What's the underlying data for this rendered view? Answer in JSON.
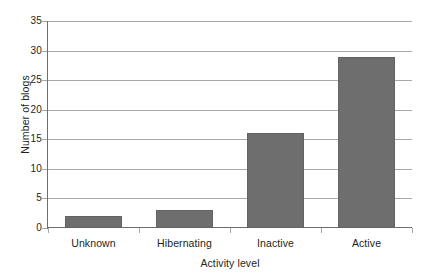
{
  "chart_data": {
    "type": "bar",
    "title": "",
    "categories": [
      "Unknown",
      "Hibernating",
      "Inactive",
      "Active"
    ],
    "values": [
      2,
      3,
      16,
      29
    ],
    "xlabel": "Activity level",
    "ylabel": "Number of blogs",
    "ylim": [
      0,
      35
    ],
    "ytick_step": 5,
    "yticks": [
      "0",
      "5",
      "10",
      "15",
      "20",
      "25",
      "30",
      "35"
    ],
    "ytick_values": [
      0,
      5,
      10,
      15,
      20,
      25,
      30,
      35
    ],
    "grid": true,
    "grid_axis": "y",
    "legend": false,
    "legend_position": "none",
    "bar_color": "#6e6e6e",
    "bar_border_color": "#636363",
    "gridline_color": "#a7a9ac",
    "axis_color": "#6d6e71",
    "background_color": "#ffffff",
    "text_color": "#231f20"
  }
}
